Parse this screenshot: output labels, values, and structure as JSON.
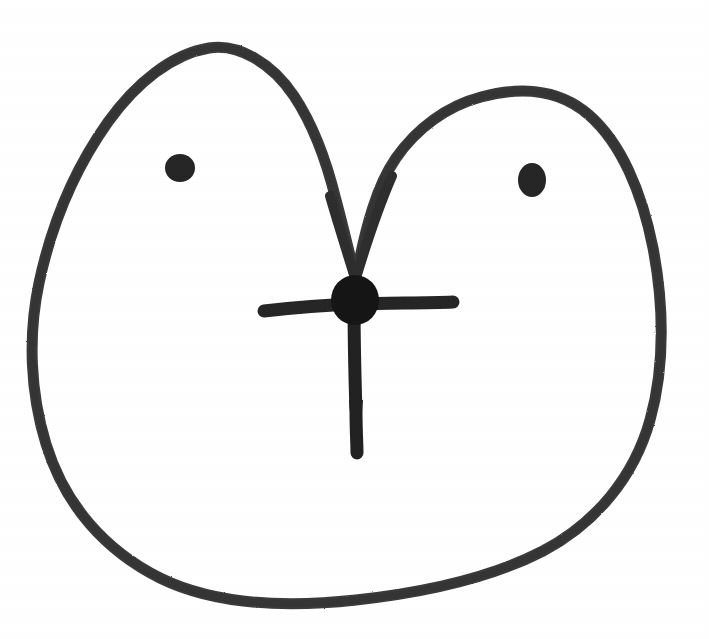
{
  "artwork": {
    "title": "Hand-drawn face doodle",
    "medium": "black marker on white paper",
    "canvas": {
      "width": 709,
      "height": 639,
      "background_color": "#ffffff"
    },
    "colors": {
      "paper": "#ffffff",
      "outline_ink": "#3a3a3a",
      "feature_ink": "#1a1a1a"
    }
  },
  "shapes": {
    "outer_contour": {
      "label": "head outline",
      "description": "closed heart-like blob with two rounded top lobes meeting in a central V valley",
      "stroke_color": "#3a3a3a",
      "stroke_width": 11,
      "path": "M 355 276 C 349 252 343 226 336 200 C 327 163 314 126 294 96 C 272 63 238 43 209 48 C 172 54 136 83 108 122 C 76 167 52 222 39 283 C 28 335 30 392 46 444 C 65 506 106 551 160 578 C 219 607 292 607 356 600 C 420 593 487 580 543 551 C 596 523 634 477 650 420 C 666 363 663 300 653 248 C 642 192 621 143 589 115 C 556 86 514 88 481 97 C 447 106 417 128 396 158 C 376 187 366 228 359 262 C 357 268 356 272 355 276 Z"
    },
    "left_eye": {
      "label": "left eye",
      "description": "small round filled blob",
      "fill_color": "#262626",
      "center_x": 180,
      "center_y": 168,
      "radius_x": 15,
      "radius_y": 14
    },
    "right_eye": {
      "label": "right eye",
      "description": "small oval filled blob, slightly taller than wide",
      "fill_color": "#262626",
      "center_x": 532,
      "center_y": 180,
      "radius_x": 14,
      "radius_y": 17
    },
    "nose_blob": {
      "label": "central nose blob",
      "description": "dark rounded blob where the V valley meets the cross",
      "fill_color": "#161616",
      "center_x": 355,
      "center_y": 300,
      "radius_x": 24,
      "radius_y": 25
    },
    "cross_horizontal": {
      "label": "horizontal bar of cross",
      "stroke_color": "#262626",
      "stroke_width": 13,
      "x_start": 264,
      "x_end": 455,
      "y": 305,
      "path": "M 264 311 C 300 307 330 305 356 304 C 390 303 424 303 453 302"
    },
    "cross_vertical": {
      "label": "vertical stem of cross",
      "stroke_color": "#222222",
      "stroke_width": 13,
      "y_start": 300,
      "y_end": 455,
      "path": "M 354 300 C 354 340 355 380 356 412 C 356 430 357 444 357 453"
    },
    "valley_left_stroke": {
      "label": "left inner curve descending into the valley",
      "stroke_color": "#2e2e2e",
      "stroke_width": 10,
      "path": "M 330 196 C 338 224 347 252 355 278"
    },
    "valley_right_stroke": {
      "label": "right inner curve descending into the valley",
      "stroke_color": "#2e2e2e",
      "stroke_width": 10,
      "path": "M 392 176 C 378 208 365 248 356 278"
    }
  },
  "composition": {
    "reading": "A large lopsided head shape with two eyes and a cross-shaped nose/mouth mark at the center."
  }
}
